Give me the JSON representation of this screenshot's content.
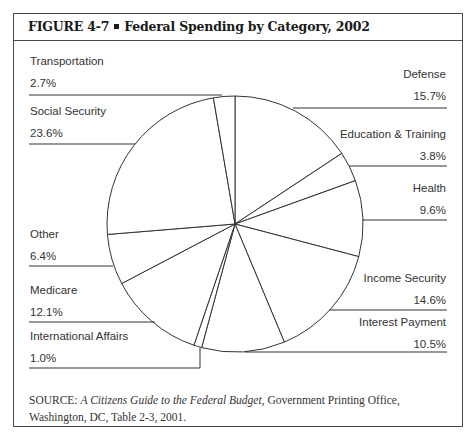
{
  "figure": {
    "number": "FIGURE  4-7",
    "title": "Federal Spending by Category, 2002",
    "source_prefix": "SOURCE: ",
    "source_title": "A Citizens Guide to the Federal Budget,",
    "source_rest": " Government Printing Office, Washington, DC, Table 2-3, 2001."
  },
  "chart_data": {
    "type": "pie",
    "title": "Federal Spending by Category, 2002",
    "start": "12 o'clock, clockwise",
    "unit": "%",
    "slices": [
      {
        "label": "Defense",
        "value": 15.7,
        "display": "15.7%"
      },
      {
        "label": "Education & Training",
        "value": 3.8,
        "display": "3.8%"
      },
      {
        "label": "Health",
        "value": 9.6,
        "display": "9.6%"
      },
      {
        "label": "Income Security",
        "value": 14.6,
        "display": "14.6%"
      },
      {
        "label": "Interest Payment",
        "value": 10.5,
        "display": "10.5%"
      },
      {
        "label": "International Affairs",
        "value": 1.0,
        "display": "1.0%"
      },
      {
        "label": "Medicare",
        "value": 12.1,
        "display": "12.1%"
      },
      {
        "label": "Other",
        "value": 6.4,
        "display": "6.4%"
      },
      {
        "label": "Social Security",
        "value": 23.6,
        "display": "23.6%"
      },
      {
        "label": "Transportation",
        "value": 2.7,
        "display": "2.7%"
      }
    ],
    "colors": {
      "stroke": "#333333",
      "fill": "#ffffff"
    }
  }
}
